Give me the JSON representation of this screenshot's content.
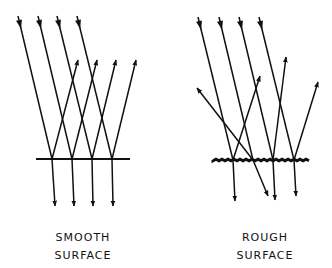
{
  "diagram": {
    "panels": [
      {
        "id": "smooth",
        "label_line1": "SMOOTH",
        "label_line2": "SURFACE",
        "surface": {
          "x1": 36,
          "x2": 130,
          "y": 159,
          "style": "straight"
        },
        "incident_rays": [
          {
            "from": [
              18,
              16
            ],
            "to": [
              52,
              159
            ]
          },
          {
            "from": [
              38,
              16
            ],
            "to": [
              72,
              159
            ]
          },
          {
            "from": [
              57,
              16
            ],
            "to": [
              92,
              159
            ]
          },
          {
            "from": [
              77,
              16
            ],
            "to": [
              112,
              159
            ]
          }
        ],
        "reflected_rays": [
          {
            "from": [
              52,
              159
            ],
            "to": [
              78,
              60
            ]
          },
          {
            "from": [
              72,
              159
            ],
            "to": [
              97,
              60
            ]
          },
          {
            "from": [
              92,
              159
            ],
            "to": [
              116,
              60
            ]
          },
          {
            "from": [
              112,
              159
            ],
            "to": [
              136,
              60
            ]
          }
        ],
        "transmitted_rays": [
          {
            "from": [
              52,
              159
            ],
            "to": [
              55,
              206
            ]
          },
          {
            "from": [
              72,
              159
            ],
            "to": [
              74,
              206
            ]
          },
          {
            "from": [
              92,
              159
            ],
            "to": [
              93,
              206
            ]
          },
          {
            "from": [
              112,
              159
            ],
            "to": [
              113,
              206
            ]
          }
        ]
      },
      {
        "id": "rough",
        "label_line1": "ROUGH",
        "label_line2": "SURFACE",
        "surface": {
          "x1": 213,
          "x2": 311,
          "y": 160,
          "style": "rough"
        },
        "incident_rays": [
          {
            "from": [
              198,
              17
            ],
            "to": [
              233,
              160
            ]
          },
          {
            "from": [
              219,
              17
            ],
            "to": [
              253,
              160
            ]
          },
          {
            "from": [
              239,
              17
            ],
            "to": [
              273,
              160
            ]
          },
          {
            "from": [
              259,
              17
            ],
            "to": [
              294,
              160
            ]
          }
        ],
        "reflected_rays": [
          {
            "from": [
              233,
              160
            ],
            "to": [
              260,
              76
            ]
          },
          {
            "from": [
              253,
              160
            ],
            "to": [
              197,
              88
            ]
          },
          {
            "from": [
              273,
              160
            ],
            "to": [
              286,
              57
            ]
          },
          {
            "from": [
              294,
              160
            ],
            "to": [
              318,
              82
            ]
          }
        ],
        "transmitted_rays": [
          {
            "from": [
              233,
              160
            ],
            "to": [
              235,
              201
            ]
          },
          {
            "from": [
              253,
              160
            ],
            "to": [
              268,
              196
            ]
          },
          {
            "from": [
              273,
              160
            ],
            "to": [
              275,
              200
            ]
          },
          {
            "from": [
              294,
              160
            ],
            "to": [
              296,
              196
            ]
          }
        ]
      }
    ]
  }
}
